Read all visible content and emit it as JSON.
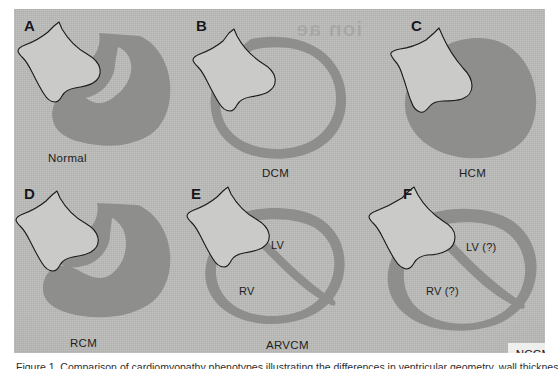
{
  "figure": {
    "background_color": "#bcbcba",
    "myocardium_color": "#8e8e8c",
    "atrium_fill_color": "#cacac8",
    "outline_color": "#1a1a1a",
    "bleed_through_text": "ion\nae",
    "caption": "Figure 1. Comparison of cardiomyopathy phenotypes illustrating the differences in ventricular geometry, wall thickness and"
  },
  "panels": [
    {
      "letter": "A",
      "caption": "Normal",
      "chamber_tags": []
    },
    {
      "letter": "B",
      "caption": "DCM",
      "chamber_tags": []
    },
    {
      "letter": "C",
      "caption": "HCM",
      "chamber_tags": []
    },
    {
      "letter": "D",
      "caption": "RCM",
      "chamber_tags": []
    },
    {
      "letter": "E",
      "caption": "ARVCM",
      "chamber_tags": [
        {
          "text": "LV"
        },
        {
          "text": "RV"
        }
      ]
    },
    {
      "letter": "F",
      "caption": "NCCM",
      "chamber_tags": [
        {
          "text": "LV (?)"
        },
        {
          "text": "RV (?)"
        }
      ]
    }
  ],
  "nccm_badge": {
    "label": "NCCM"
  }
}
